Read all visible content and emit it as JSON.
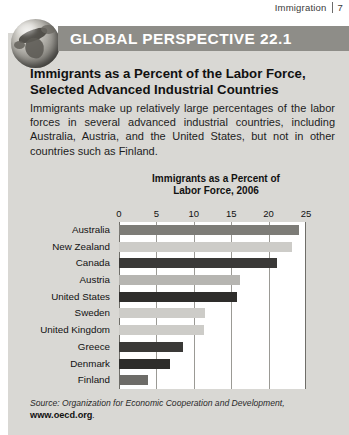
{
  "running_head": {
    "text": "Immigration",
    "page_number": "7"
  },
  "banner": {
    "label": "GLOBAL PERSPECTIVE 22.1",
    "icon": "globe-icon",
    "bar_color": "#8e8d88",
    "text_color": "#ffffff"
  },
  "headline": "Immigrants as a Percent of the Labor Force, Selected Advanced Industrial Countries",
  "blurb": "Immigrants make up relatively large percentages of the labor forces in several advanced industrial countries, including Australia, Austria, and the United States, but not in other countries such as Finland.",
  "source": {
    "text": "Source: Organization for Economic Cooperation and Development,",
    "url": "www.oecd.org",
    "url_suffix": "."
  },
  "chart_data": {
    "type": "bar",
    "orientation": "horizontal",
    "title": "Immigrants as a Percent of Labor Force, 2006",
    "title_line1": "Immigrants as a Percent of",
    "title_line2": "Labor Force, 2006",
    "xlabel": "",
    "ylabel": "",
    "xlim": [
      0,
      25
    ],
    "ticks": [
      0,
      5,
      10,
      15,
      20,
      25
    ],
    "tick_labels": [
      "0",
      "5",
      "10",
      "15",
      "20",
      "25"
    ],
    "grid": true,
    "legend": "none",
    "categories": [
      "Australia",
      "New Zealand",
      "Canada",
      "Austria",
      "United States",
      "Sweden",
      "United Kingdom",
      "Greece",
      "Denmark",
      "Finland"
    ],
    "values": [
      24.0,
      23.1,
      21.1,
      16.2,
      15.8,
      11.5,
      11.4,
      8.6,
      6.8,
      3.9
    ],
    "bar_colors": [
      "#7d7c77",
      "#cdccc8",
      "#3a3937",
      "#b6b5b1",
      "#2e2d2b",
      "#cdccc8",
      "#cdccc8",
      "#3a3937",
      "#2e2d2b",
      "#6d6c68"
    ],
    "plot_background": "#ffffff",
    "gridline_color": "#9b9a95"
  },
  "panel": {
    "background": "#d9d8d4"
  }
}
